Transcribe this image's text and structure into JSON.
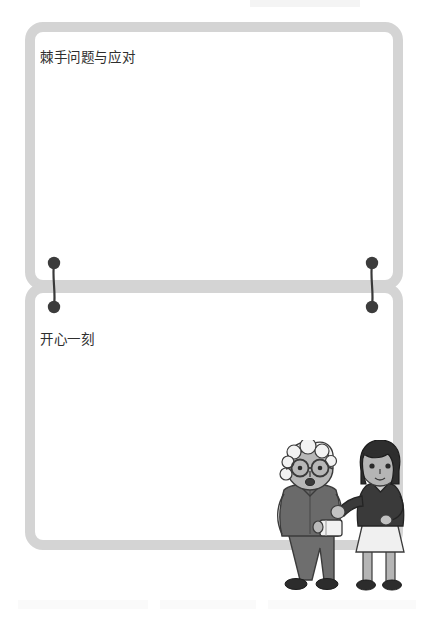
{
  "page": {
    "background_color": "#ffffff",
    "width": 428,
    "height": 619
  },
  "cards": [
    {
      "id": "card-top",
      "title": "棘手问题与应对",
      "border_color": "#d4d4d4",
      "background_color": "#ffffff",
      "body_text": ""
    },
    {
      "id": "card-bottom",
      "title": "开心一刻",
      "border_color": "#d4d4d4",
      "background_color": "#ffffff",
      "body_text": ""
    }
  ],
  "connectors": {
    "color": "#3a3a3a",
    "left": {
      "name": "left-binder-clip"
    },
    "right": {
      "name": "right-binder-clip"
    }
  },
  "illustration": {
    "name": "two-people-illustration",
    "figures": [
      {
        "name": "elderly-person-with-glasses",
        "hair_color": "#efefef",
        "skin_color": "#b9b9b9",
        "clothing_color": "#6a6a6a",
        "accessory": "eyeglasses"
      },
      {
        "name": "young-woman-bob-haircut",
        "hair_color": "#2e2e2e",
        "skin_color": "#b5b5b5",
        "top_color": "#3a3a3a",
        "skirt_color": "#f0f0f0"
      }
    ]
  },
  "icons": {
    "dot": "filled-circle-icon",
    "clip_line": "vertical-line-icon"
  }
}
